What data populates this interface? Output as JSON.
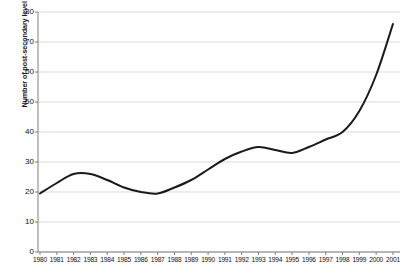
{
  "chart_data": {
    "type": "line",
    "title": "",
    "xlabel": "",
    "ylabel": "Number of post-secondary level foreign students (000s)",
    "ylim": [
      0,
      80
    ],
    "yticks": [
      0,
      10,
      20,
      30,
      40,
      50,
      60,
      70,
      80
    ],
    "ytick_labels": [
      "0",
      "10",
      "20",
      "30",
      "40",
      "50",
      "60",
      "70",
      "80"
    ],
    "grid": true,
    "grid_axis": "y",
    "legend": false,
    "legend_position": "none",
    "line_color": "#1a1a1a",
    "grid_color": "#d9d9d9",
    "axis_color": "#808080",
    "background_color": "#ffffff",
    "categories": [
      "1980",
      "1981",
      "1982",
      "1983",
      "1984",
      "1985",
      "1986",
      "1987",
      "1988",
      "1989",
      "1990",
      "1991",
      "1992",
      "1993",
      "1994",
      "1995",
      "1996",
      "1997",
      "1998",
      "1999",
      "2000",
      "2001"
    ],
    "values": [
      19.5,
      23.0,
      26.0,
      26.0,
      24.0,
      21.5,
      20.0,
      19.5,
      21.5,
      24.0,
      27.5,
      31.0,
      33.5,
      35.0,
      34.0,
      33.0,
      35.0,
      37.5,
      40.0,
      47.0,
      59.0,
      76.0
    ],
    "series": [
      {
        "name": "Post-secondary level foreign students",
        "values": [
          19.5,
          23.0,
          26.0,
          26.0,
          24.0,
          21.5,
          20.0,
          19.5,
          21.5,
          24.0,
          27.5,
          31.0,
          33.5,
          35.0,
          34.0,
          33.0,
          35.0,
          37.5,
          40.0,
          47.0,
          59.0,
          76.0
        ]
      }
    ]
  }
}
